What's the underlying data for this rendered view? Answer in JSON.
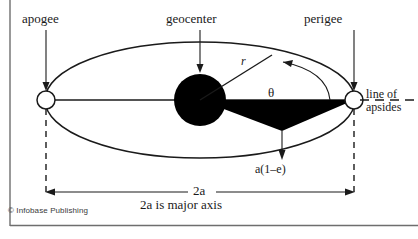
{
  "figure": {
    "credit": "© Infobase Publishing",
    "colors": {
      "stroke": "#1a1a1a",
      "fill_body": "#000000",
      "background": "#ffffff",
      "frame": "#6e6e6e"
    }
  },
  "labels": {
    "apogee": "apogee",
    "geocenter": "geocenter",
    "perigee": "perigee",
    "radius": "r",
    "theta": "θ",
    "line_of": "line of",
    "apsides": "apsides",
    "perigee_distance": "a(1–e)",
    "major_axis_symbol": "2a",
    "major_axis_caption": "2a is major axis"
  },
  "geometry": {
    "ellipse": {
      "cx": 200,
      "cy": 100,
      "rx": 155,
      "ry": 58
    },
    "geocenter_body": {
      "cx": 200,
      "cy": 100,
      "r": 26
    },
    "apogee_marker": {
      "cx": 46,
      "cy": 100,
      "r": 9
    },
    "perigee_marker": {
      "cx": 354,
      "cy": 100,
      "r": 9
    },
    "satellite_point": {
      "x": 272,
      "y": 55
    },
    "wedge_bottom_vertex": {
      "x": 282,
      "y": 131
    },
    "dimension_line_y": 192,
    "dashed_line_bottom_y": 196
  }
}
